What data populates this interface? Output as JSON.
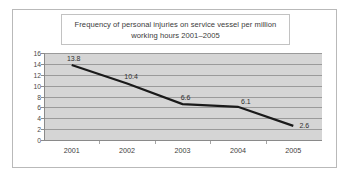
{
  "chart_data": {
    "type": "line",
    "title": "Frequency of personal injuries on service vessel per million working hours 2001–2005",
    "xlabel": "",
    "ylabel": "",
    "categories": [
      "2001",
      "2002",
      "2003",
      "2004",
      "2005"
    ],
    "values": [
      13.8,
      10.4,
      6.6,
      6.1,
      2.6
    ],
    "data_labels": [
      "13.8",
      "10.4",
      "6.6",
      "6.1",
      "2.6"
    ],
    "ylim": [
      0,
      16
    ],
    "yticks": [
      0,
      2,
      4,
      6,
      8,
      10,
      12,
      14,
      16
    ],
    "ytick_labels": [
      "0",
      "2",
      "4",
      "6",
      "8",
      "10",
      "12",
      "14",
      "16"
    ],
    "grid": true,
    "legend": null,
    "series": [
      {
        "name": "Injury frequency",
        "values": [
          13.8,
          10.4,
          6.6,
          6.1,
          2.6
        ]
      }
    ],
    "colors": {
      "line": "#1a1a1a",
      "plot_background": "#d5d5d5",
      "gridline": "#9a9a9a",
      "axis": "#8a8a8a",
      "frame_border": "#b9b9b9",
      "title_border": "#c2c2c2",
      "text": "#3b3b3b"
    }
  }
}
